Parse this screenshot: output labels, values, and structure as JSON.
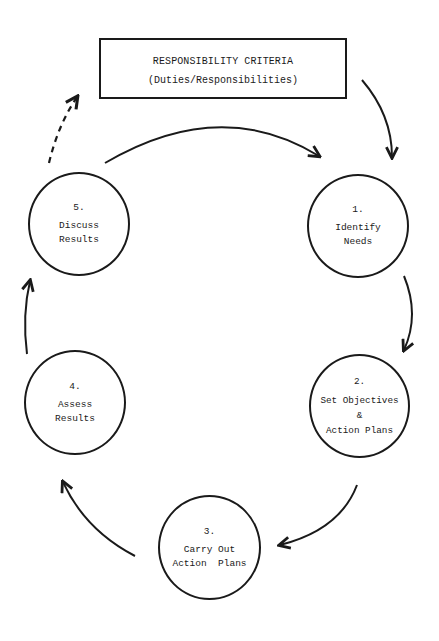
{
  "diagram": {
    "type": "cycle",
    "criteria_box": {
      "title": "RESPONSIBILITY CRITERIA",
      "subtitle": "(Duties/Responsibilities)"
    },
    "steps": [
      {
        "number": "1.",
        "line1": "Identify",
        "line2": "Needs"
      },
      {
        "number": "2.",
        "line1": "Set Objectives",
        "amp": "&",
        "line2": "Action Plans"
      },
      {
        "number": "3.",
        "line1": "Carry Out",
        "line2": "Action  Plans"
      },
      {
        "number": "4.",
        "line1": "Assess",
        "line2": "Results"
      },
      {
        "number": "5.",
        "line1": "Discuss",
        "line2": "Results"
      }
    ],
    "edges": [
      {
        "from": "criteria_box",
        "to": "step-1",
        "style": "solid"
      },
      {
        "from": "step-1",
        "to": "step-2",
        "style": "solid"
      },
      {
        "from": "step-2",
        "to": "step-3",
        "style": "solid"
      },
      {
        "from": "step-3",
        "to": "step-4",
        "style": "solid"
      },
      {
        "from": "step-4",
        "to": "step-5",
        "style": "solid"
      },
      {
        "from": "step-5",
        "to": "step-1",
        "style": "solid"
      },
      {
        "from": "step-5",
        "to": "criteria_box",
        "style": "dashed"
      }
    ],
    "colors": {
      "ink": "#1a1a1a",
      "background": "#ffffff"
    }
  }
}
